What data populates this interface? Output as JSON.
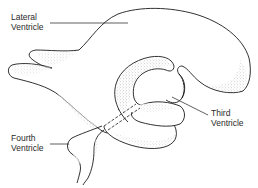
{
  "diagram": {
    "colors": {
      "outline": "#1a1a1a",
      "stipple": "#8a8a8a",
      "background": "#ffffff",
      "text": "#2a2a2a"
    },
    "labels": [
      {
        "id": "lateral",
        "line1": "Lateral",
        "line2": "Ventricle"
      },
      {
        "id": "third",
        "line1": "Third",
        "line2": "Ventricle"
      },
      {
        "id": "fourth",
        "line1": "Fourth",
        "line2": "Ventricle"
      }
    ]
  }
}
